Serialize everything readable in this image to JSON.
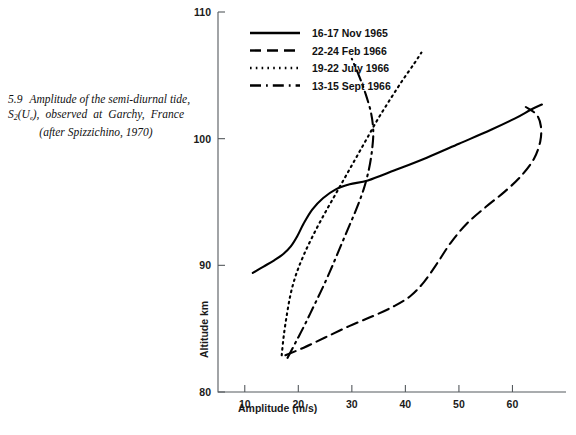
{
  "caption": {
    "number": "5.9",
    "line1": "Amplitude of the semi-diurnal tide,",
    "line2_pre": "S",
    "line2_sub": "2",
    "line2_mid": "(U",
    "line2_subsub": "e",
    "line2_post": "), observed at Garchy, France",
    "line3": "(after Spizzichino, 1970)"
  },
  "axes": {
    "x_label": "Amplitude (m/s)",
    "y_label": "Altitude km",
    "x_ticks": [
      "10",
      "20",
      "30",
      "40",
      "50",
      "60"
    ],
    "x_tick_values": [
      10,
      20,
      30,
      40,
      50,
      60
    ],
    "y_ticks": [
      "80",
      "90",
      "100",
      "110"
    ],
    "y_tick_values": [
      80,
      90,
      100,
      110
    ],
    "xlim": [
      5,
      70
    ],
    "ylim": [
      80,
      110
    ]
  },
  "legend": {
    "entries": [
      {
        "label": "16-17 Nov  1965",
        "style": "solid"
      },
      {
        "label": "22-24 Feb  1966",
        "style": "dashed"
      },
      {
        "label": "19-22 July  1966",
        "style": "dotted"
      },
      {
        "label": "13-15 Sept 1966",
        "style": "dash-dot"
      }
    ]
  },
  "chart_data": {
    "type": "line",
    "title": "",
    "xlabel": "Amplitude (m/s)",
    "ylabel": "Altitude km",
    "xlim": [
      5,
      70
    ],
    "ylim": [
      80,
      110
    ],
    "grid": false,
    "legend_position": "top-left-inside",
    "x_ticks": [
      10,
      20,
      30,
      40,
      50,
      60
    ],
    "y_ticks": [
      80,
      90,
      100,
      110
    ],
    "series": [
      {
        "name": "16-17 Nov  1965",
        "style": "solid",
        "points": [
          [
            11.5,
            89.4
          ],
          [
            13.5,
            89.9
          ],
          [
            15.5,
            90.4
          ],
          [
            17.2,
            90.9
          ],
          [
            18.6,
            91.5
          ],
          [
            19.8,
            92.3
          ],
          [
            21.0,
            93.3
          ],
          [
            22.6,
            94.4
          ],
          [
            24.6,
            95.3
          ],
          [
            27.0,
            96.0
          ],
          [
            29.6,
            96.4
          ],
          [
            33.0,
            96.7
          ],
          [
            38.0,
            97.5
          ],
          [
            44.0,
            98.5
          ],
          [
            50.0,
            99.6
          ],
          [
            56.0,
            100.7
          ],
          [
            60.5,
            101.6
          ],
          [
            63.5,
            102.3
          ],
          [
            65.5,
            102.7
          ]
        ]
      },
      {
        "name": "22-24 Feb  1966",
        "style": "dashed",
        "points": [
          [
            17.6,
            82.9
          ],
          [
            21.0,
            83.5
          ],
          [
            25.0,
            84.3
          ],
          [
            29.5,
            85.2
          ],
          [
            34.0,
            86.0
          ],
          [
            38.0,
            86.8
          ],
          [
            41.0,
            87.6
          ],
          [
            43.5,
            88.7
          ],
          [
            46.0,
            90.2
          ],
          [
            48.5,
            91.8
          ],
          [
            51.5,
            93.3
          ],
          [
            55.0,
            94.6
          ],
          [
            58.5,
            95.8
          ],
          [
            61.5,
            97.0
          ],
          [
            64.0,
            98.4
          ],
          [
            65.2,
            99.8
          ],
          [
            65.3,
            101.0
          ],
          [
            64.5,
            101.9
          ],
          [
            62.5,
            102.5
          ]
        ]
      },
      {
        "name": "19-22 July  1966",
        "style": "dotted",
        "points": [
          [
            16.9,
            82.9
          ],
          [
            17.3,
            84.5
          ],
          [
            17.9,
            86.2
          ],
          [
            18.6,
            87.8
          ],
          [
            19.6,
            89.3
          ],
          [
            21.0,
            90.8
          ],
          [
            22.8,
            92.4
          ],
          [
            24.8,
            94.0
          ],
          [
            26.8,
            95.5
          ],
          [
            28.8,
            97.0
          ],
          [
            30.8,
            98.5
          ],
          [
            32.8,
            100.0
          ],
          [
            34.8,
            101.5
          ],
          [
            37.0,
            103.0
          ],
          [
            39.3,
            104.5
          ],
          [
            41.6,
            105.9
          ],
          [
            43.0,
            106.8
          ]
        ]
      },
      {
        "name": "13-15 Sept 1966",
        "style": "dash-dot",
        "points": [
          [
            18.0,
            82.7
          ],
          [
            19.6,
            84.0
          ],
          [
            21.2,
            85.3
          ],
          [
            22.8,
            86.7
          ],
          [
            24.4,
            88.1
          ],
          [
            26.0,
            89.6
          ],
          [
            27.6,
            91.2
          ],
          [
            29.2,
            92.8
          ],
          [
            30.8,
            94.4
          ],
          [
            32.2,
            96.0
          ],
          [
            33.2,
            97.6
          ],
          [
            33.8,
            99.2
          ],
          [
            34.0,
            100.6
          ],
          [
            33.6,
            102.0
          ],
          [
            32.6,
            103.5
          ],
          [
            31.3,
            105.0
          ],
          [
            30.0,
            106.3
          ]
        ]
      }
    ]
  }
}
